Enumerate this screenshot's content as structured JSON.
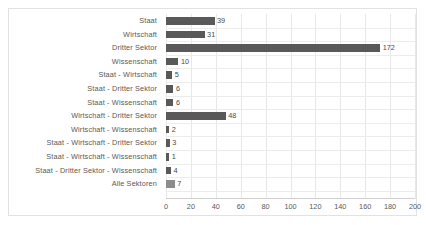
{
  "chart_data": {
    "type": "bar",
    "orientation": "horizontal",
    "title": "",
    "xlabel": "",
    "ylabel": "",
    "xlim": [
      0,
      200
    ],
    "xticks": [
      0,
      20,
      40,
      60,
      80,
      100,
      120,
      140,
      160,
      180,
      200
    ],
    "grid": true,
    "legend": false,
    "bar_color": "#595959",
    "last_bar_color": "#8c8c8c",
    "categories": [
      "Staat",
      "Wirtschaft",
      "Dritter Sektor",
      "Wissenschaft",
      "Staat - Wirtschaft",
      "Staat - Dritter Sektor",
      "Staat - Wissenschaft",
      "Wirtschaft - Dritter Sektor",
      "Wirtschaft - Wissenschaft",
      "Staat - Wirtschaft - Dritter Sektor",
      "Staat - Wirtschaft - Wissenschaft",
      "Staat - Dritter Sektor - Wissenschaft",
      "Alle Sektoren"
    ],
    "values": [
      39,
      31,
      172,
      10,
      5,
      6,
      6,
      48,
      2,
      3,
      1,
      4,
      7
    ],
    "data_labels": [
      "39",
      "31",
      "172",
      "10",
      "5",
      "6",
      "6",
      "48",
      "2",
      "3",
      "1",
      "4",
      "7"
    ],
    "xtick_labels": [
      "0",
      "20",
      "40",
      "60",
      "80",
      "100",
      "120",
      "140",
      "160",
      "180",
      "200"
    ]
  }
}
